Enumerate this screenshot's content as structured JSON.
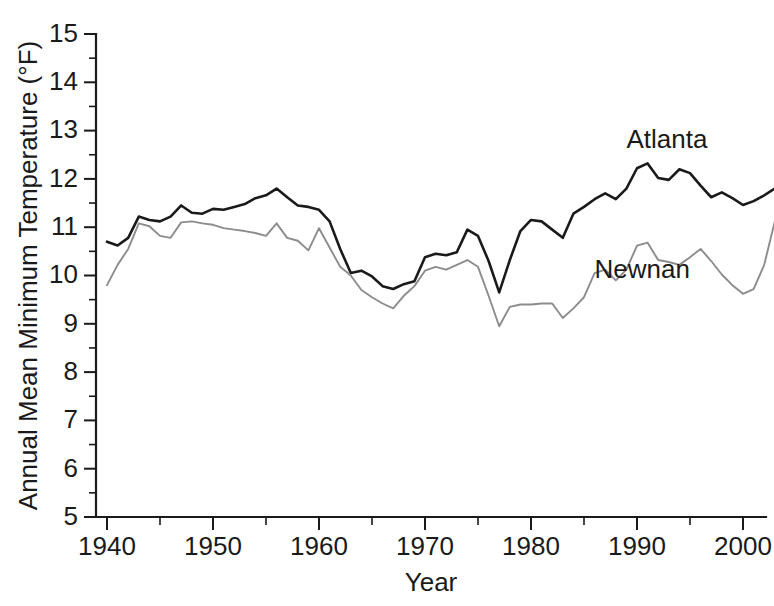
{
  "chart_data": {
    "type": "line",
    "title": "",
    "xlabel": "Year",
    "ylabel": "Annual Mean Minimum Temperature (°F)",
    "xlim": [
      1939,
      2004
    ],
    "ylim": [
      5,
      15
    ],
    "grid": false,
    "legend_position": "inline-annotation",
    "x_major_ticks": [
      1940,
      1950,
      1960,
      1970,
      1980,
      1990,
      2000
    ],
    "x_major_tick_labels": [
      "1940",
      "1950",
      "1960",
      "1970",
      "1980",
      "1990",
      "2000"
    ],
    "x_minor_tick_interval": 5,
    "y_major_ticks": [
      5,
      6,
      7,
      8,
      9,
      10,
      11,
      12,
      13,
      14,
      15
    ],
    "y_major_tick_labels": [
      "5",
      "6",
      "7",
      "8",
      "9",
      "10",
      "11",
      "12",
      "13",
      "14",
      "15"
    ],
    "y_minor_tick_interval": 0.5,
    "x": [
      1940,
      1941,
      1942,
      1943,
      1944,
      1945,
      1946,
      1947,
      1948,
      1949,
      1950,
      1951,
      1952,
      1953,
      1954,
      1955,
      1956,
      1957,
      1958,
      1959,
      1960,
      1961,
      1962,
      1963,
      1964,
      1965,
      1966,
      1967,
      1968,
      1969,
      1970,
      1971,
      1972,
      1973,
      1974,
      1975,
      1976,
      1977,
      1978,
      1979,
      1980,
      1981,
      1982,
      1983,
      1984,
      1985,
      1986,
      1987,
      1988,
      1989,
      1990,
      1991,
      1992,
      1993,
      1994,
      1995,
      1996,
      1997,
      1998,
      1999,
      2000,
      2001,
      2002,
      2003
    ],
    "series": [
      {
        "name": "Atlanta",
        "color": "#1a1a1a",
        "line_width": 2.6,
        "label_x": 1989,
        "label_y": 12.65,
        "values": [
          10.7,
          10.62,
          10.78,
          11.22,
          11.15,
          11.12,
          11.22,
          11.45,
          11.3,
          11.28,
          11.38,
          11.36,
          11.42,
          11.48,
          11.6,
          11.66,
          11.8,
          11.62,
          11.45,
          11.42,
          11.36,
          11.12,
          10.55,
          10.05,
          10.1,
          9.98,
          9.78,
          9.72,
          9.82,
          9.88,
          10.38,
          10.45,
          10.42,
          10.48,
          10.95,
          10.82,
          10.3,
          9.65,
          10.32,
          10.92,
          11.15,
          11.12,
          10.95,
          10.78,
          11.28,
          11.42,
          11.58,
          11.7,
          11.58,
          11.8,
          12.22,
          12.32,
          12.02,
          11.98,
          12.2,
          12.12,
          11.86,
          11.62,
          11.72,
          11.6,
          11.46,
          11.54,
          11.66,
          11.8
        ]
      },
      {
        "name": "Newnan",
        "color": "#8c8c8c",
        "line_width": 1.9,
        "label_x": 1986,
        "label_y": 9.95,
        "values": [
          9.8,
          10.22,
          10.55,
          11.08,
          11.02,
          10.82,
          10.78,
          11.1,
          11.12,
          11.08,
          11.05,
          10.98,
          10.95,
          10.92,
          10.88,
          10.82,
          11.08,
          10.78,
          10.72,
          10.52,
          10.98,
          10.58,
          10.18,
          10.0,
          9.7,
          9.55,
          9.42,
          9.32,
          9.58,
          9.78,
          10.1,
          10.18,
          10.12,
          10.22,
          10.32,
          10.18,
          9.58,
          8.95,
          9.35,
          9.4,
          9.4,
          9.42,
          9.42,
          9.12,
          9.32,
          9.55,
          10.05,
          10.12,
          9.9,
          10.12,
          10.62,
          10.68,
          10.32,
          10.28,
          10.22,
          10.38,
          10.55,
          10.3,
          10.02,
          9.8,
          9.62,
          9.72,
          10.22,
          11.12
        ]
      }
    ]
  },
  "axes": {
    "x_title": "Year",
    "y_title": "Annual Mean Minimum Temperature (°F)"
  },
  "annotations": {
    "atlanta_label": "Atlanta",
    "newnan_label": "Newnan"
  }
}
